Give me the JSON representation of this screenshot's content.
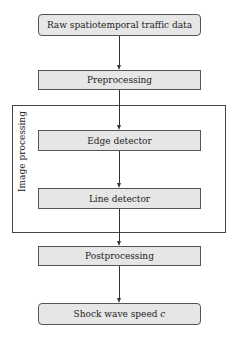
{
  "diagram": {
    "nodes": [
      {
        "id": "raw",
        "label": "Raw spatiotemporal traffic data",
        "shape": "rounded"
      },
      {
        "id": "pre",
        "label": "Preprocessing",
        "shape": "rect"
      },
      {
        "id": "edge",
        "label": "Edge detector",
        "shape": "rect"
      },
      {
        "id": "line",
        "label": "Line detector",
        "shape": "rect"
      },
      {
        "id": "post",
        "label": "Postprocessing",
        "shape": "rect"
      },
      {
        "id": "out",
        "label_main": "Shock wave speed ",
        "label_var": "c",
        "shape": "rounded"
      }
    ],
    "group": {
      "label": "Image processing",
      "contains": [
        "edge",
        "line"
      ]
    },
    "edges": [
      [
        "raw",
        "pre"
      ],
      [
        "pre",
        "edge"
      ],
      [
        "edge",
        "line"
      ],
      [
        "line",
        "post"
      ],
      [
        "post",
        "out"
      ]
    ],
    "colors": {
      "box_fill": "#e6e6e6",
      "stroke": "#333333"
    }
  }
}
